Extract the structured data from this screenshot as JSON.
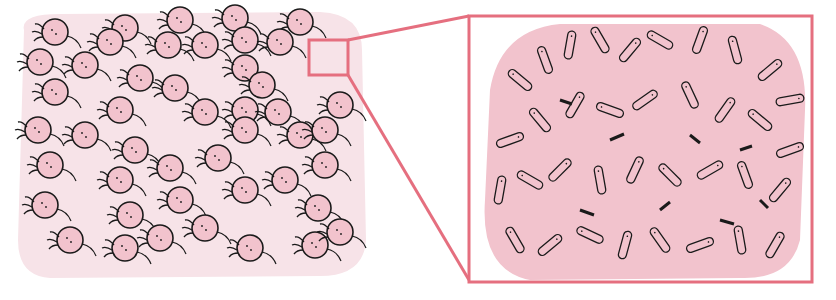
{
  "illustration": {
    "description": "Colony of rounded pink cells with a magnified inset of branching rod-shaped structures",
    "colors": {
      "background": "#ffffff",
      "colony_bg": "#f7e3e8",
      "cell_fill": "#f2c3cd",
      "outline": "#1a1a1a",
      "highlight_frame": "#e56f7f"
    },
    "left_panel": {
      "x": 18,
      "y": 14,
      "width": 348,
      "height": 262
    },
    "zoom_box": {
      "x": 309,
      "y": 40,
      "width": 39,
      "height": 35
    },
    "inset_panel": {
      "x": 469,
      "y": 16,
      "width": 343,
      "height": 266
    }
  }
}
